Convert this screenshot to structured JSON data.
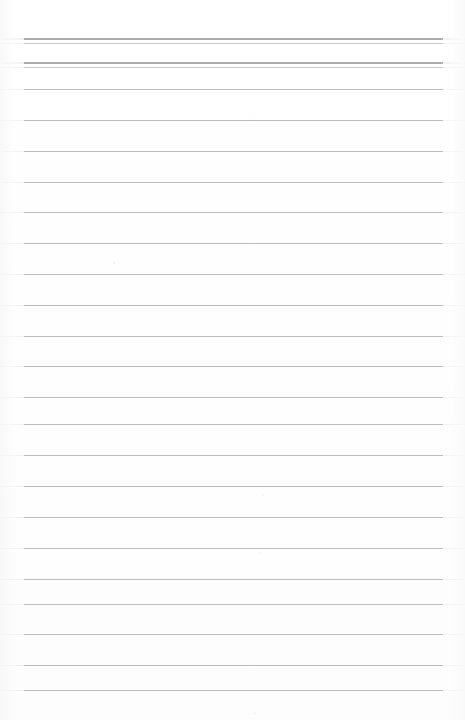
{
  "document": {
    "kind": "scanned-ruled-notepad-page",
    "title": "Blank Ruled Notepad Page",
    "content_text": "",
    "page_width": 465,
    "page_height": 720,
    "background_color": "#ffffff",
    "rule_color": "#b9bcc0",
    "rule_color_heavy": "#a7abb0",
    "rule_color_hair": "#c8cbcf",
    "rule_left_x": 24,
    "rule_right_x": 443,
    "rule_span_width": 419,
    "line_spacing": 30.8,
    "line_count": 22,
    "header_rule_group_count": 2
  },
  "header": {
    "label": "header-rule-band",
    "groups": [
      {
        "name": "header-double-rule-1",
        "top": 38,
        "gap": 4
      },
      {
        "name": "header-double-rule-2",
        "top": 62,
        "gap": 4
      }
    ]
  },
  "rules": [
    {
      "name": "header-rule-1a",
      "y": 38,
      "weight": "heavy"
    },
    {
      "name": "header-rule-1b",
      "y": 43,
      "weight": "hair"
    },
    {
      "name": "header-rule-2a",
      "y": 62,
      "weight": "heavy"
    },
    {
      "name": "header-rule-2b",
      "y": 67,
      "weight": "hair"
    },
    {
      "name": "body-rule-1",
      "y": 89,
      "weight": "normal"
    },
    {
      "name": "body-rule-2",
      "y": 120,
      "weight": "normal"
    },
    {
      "name": "body-rule-3",
      "y": 151,
      "weight": "normal"
    },
    {
      "name": "body-rule-4",
      "y": 182,
      "weight": "normal"
    },
    {
      "name": "body-rule-5",
      "y": 212,
      "weight": "normal"
    },
    {
      "name": "body-rule-6",
      "y": 243,
      "weight": "normal"
    },
    {
      "name": "body-rule-7",
      "y": 274,
      "weight": "normal"
    },
    {
      "name": "body-rule-8",
      "y": 305,
      "weight": "normal"
    },
    {
      "name": "body-rule-9",
      "y": 336,
      "weight": "normal"
    },
    {
      "name": "body-rule-10",
      "y": 366,
      "weight": "normal"
    },
    {
      "name": "body-rule-11",
      "y": 397,
      "weight": "normal"
    },
    {
      "name": "body-rule-12",
      "y": 424,
      "weight": "normal"
    },
    {
      "name": "body-rule-13",
      "y": 455,
      "weight": "normal"
    },
    {
      "name": "body-rule-14",
      "y": 486,
      "weight": "normal"
    },
    {
      "name": "body-rule-15",
      "y": 517,
      "weight": "normal"
    },
    {
      "name": "body-rule-16",
      "y": 548,
      "weight": "normal"
    },
    {
      "name": "body-rule-17",
      "y": 579,
      "weight": "normal"
    },
    {
      "name": "body-rule-18",
      "y": 604,
      "weight": "normal"
    },
    {
      "name": "body-rule-19",
      "y": 634,
      "weight": "normal"
    },
    {
      "name": "body-rule-20",
      "y": 665,
      "weight": "normal"
    },
    {
      "name": "body-rule-21",
      "y": 690,
      "weight": "normal"
    }
  ],
  "artifacts": [
    {
      "name": "scan-speckle-1",
      "x": 113,
      "y": 262,
      "size": 2,
      "opacity": 0.55
    },
    {
      "name": "scan-speckle-2",
      "x": 262,
      "y": 494,
      "size": 2,
      "opacity": 0.45
    },
    {
      "name": "scan-speckle-3",
      "x": 259,
      "y": 552,
      "size": 2,
      "opacity": 0.4
    },
    {
      "name": "scan-speckle-4",
      "x": 253,
      "y": 712,
      "size": 3,
      "opacity": 0.4
    }
  ]
}
